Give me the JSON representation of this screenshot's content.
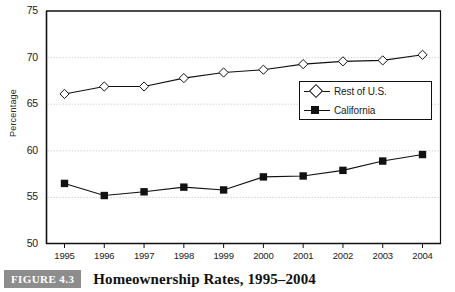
{
  "figure": {
    "badge_label": "FIGURE 4.3",
    "caption": "Homeownership Rates, 1995–2004",
    "badge_color": "#8d8d8d"
  },
  "chart_data": {
    "type": "line",
    "title": "",
    "xlabel": "",
    "ylabel": "Percentage",
    "categories": [
      "1995",
      "1996",
      "1997",
      "1998",
      "1999",
      "2000",
      "2001",
      "2002",
      "2003",
      "2004"
    ],
    "x": [
      1995,
      1996,
      1997,
      1998,
      1999,
      2000,
      2001,
      2002,
      2003,
      2004
    ],
    "series": [
      {
        "name": "Rest of U.S.",
        "marker": "open-diamond",
        "color": "#111111",
        "values": [
          66.1,
          66.9,
          66.9,
          67.8,
          68.4,
          68.7,
          69.3,
          69.6,
          69.7,
          70.3
        ]
      },
      {
        "name": "California",
        "marker": "filled-square",
        "color": "#111111",
        "values": [
          56.5,
          55.2,
          55.6,
          56.1,
          55.8,
          57.2,
          57.3,
          57.9,
          58.9,
          59.6
        ]
      }
    ],
    "ylim": [
      50,
      75
    ],
    "yticks": [
      50,
      55,
      60,
      65,
      70,
      75
    ],
    "ytick_labels": [
      "50",
      "55",
      "60",
      "65",
      "70",
      "75"
    ],
    "grid": true,
    "grid_axis": "y",
    "legend_position": "center-right"
  }
}
